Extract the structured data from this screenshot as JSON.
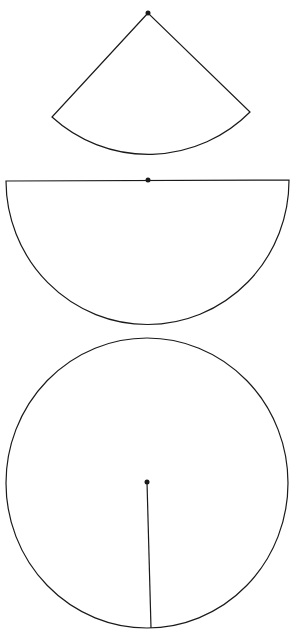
{
  "diagram": {
    "stroke_color": "#1a1a1a",
    "background": "#ffffff",
    "figures": [
      {
        "type": "sector",
        "center": [
          148,
          13
        ],
        "left_end": [
          52,
          117
        ],
        "right_end": [
          250,
          112
        ],
        "radius": 143
      },
      {
        "type": "semicircle",
        "center": [
          148,
          180
        ],
        "diameter_left": [
          6,
          181
        ],
        "diameter_right": [
          289,
          180
        ],
        "radius": 143
      },
      {
        "type": "circle",
        "center": [
          147,
          482
        ],
        "rx": 141,
        "ry": 145,
        "radius_end": [
          151,
          628
        ]
      }
    ]
  }
}
